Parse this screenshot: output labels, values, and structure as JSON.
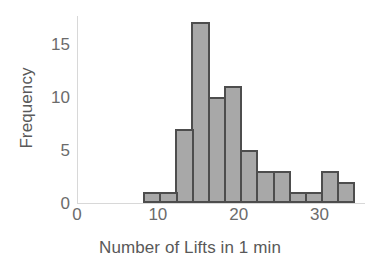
{
  "chart_data": {
    "type": "bar",
    "chart_subtype": "histogram",
    "title": "",
    "xlabel": "Number of Lifts in 1 min",
    "ylabel": "Frequency",
    "xlim": [
      0,
      35.5
    ],
    "ylim": [
      0,
      17.6
    ],
    "grid": false,
    "legend": null,
    "bin_width": 2,
    "bin_edges": [
      8,
      10,
      12,
      14,
      16,
      18,
      20,
      22,
      24,
      26,
      28,
      30,
      32,
      34
    ],
    "categories": [
      "8-10",
      "10-12",
      "12-14",
      "14-16",
      "16-18",
      "18-20",
      "20-22",
      "22-24",
      "24-26",
      "26-28",
      "28-30",
      "30-32",
      "32-34"
    ],
    "values": [
      1,
      1,
      7,
      17,
      10,
      11,
      5,
      3,
      3,
      1,
      1,
      3,
      2
    ],
    "xticks": [
      {
        "value": 0,
        "label": "0"
      },
      {
        "value": 10,
        "label": "10"
      },
      {
        "value": 20,
        "label": "20"
      },
      {
        "value": 30,
        "label": "30"
      }
    ],
    "yticks": [
      {
        "value": 0,
        "label": "0"
      },
      {
        "value": 5,
        "label": "5"
      },
      {
        "value": 10,
        "label": "10"
      },
      {
        "value": 15,
        "label": "15"
      }
    ],
    "colors": {
      "bar_fill": "#a8a8a8",
      "bar_edge": "#4d4d4d",
      "axis": "#d8d8d8",
      "tick_text": "#6b6b6b",
      "axis_title": "#595959",
      "background": "#ffffff"
    }
  }
}
